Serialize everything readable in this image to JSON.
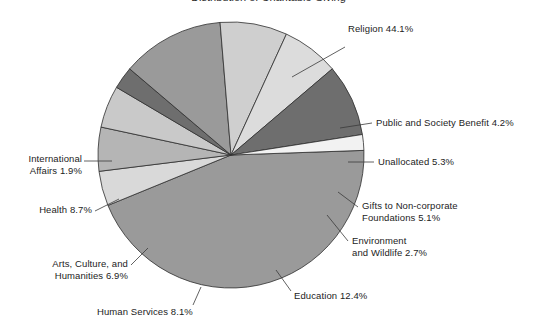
{
  "title": "Distribution of Charitable Giving",
  "chart_data": {
    "type": "pie",
    "title": "Distribution of Charitable Giving",
    "xlabel": "",
    "ylabel": "",
    "legend_position": "none",
    "grid": false,
    "labels_outside": true,
    "categories": [
      "Religion",
      "Public and Society Benefit",
      "Unallocated",
      "Gifts to Non-corporate Foundations",
      "Environment and Wildlife",
      "Education",
      "Human Services",
      "Arts, Culture, and Humanities",
      "Health",
      "International Affairs"
    ],
    "values": [
      44.1,
      4.2,
      5.3,
      5.1,
      2.7,
      12.4,
      8.1,
      6.9,
      8.7,
      1.9
    ],
    "value_suffix": "%",
    "colors": [
      "#9a9a9a",
      "#d9d9d9",
      "#b5b5b5",
      "#c9c9c9",
      "#6e6e6e",
      "#9a9a9a",
      "#cfcfcf",
      "#dcdcdc",
      "#6e6e6e",
      "#f2f2f2"
    ],
    "start_angle_deg": -2,
    "direction": "clockwise"
  },
  "slices": [
    {
      "name": "religion",
      "label": "Religion 44.1%"
    },
    {
      "name": "public-society",
      "label": "Public and Society Benefit 4.2%"
    },
    {
      "name": "unallocated",
      "label": "Unallocated 5.3%"
    },
    {
      "name": "gifts-foundations",
      "label": "Gifts to Non-corporate\nFoundations 5.1%"
    },
    {
      "name": "environment",
      "label": "Environment\nand Wildlife 2.7%"
    },
    {
      "name": "education",
      "label": "Education 12.4%"
    },
    {
      "name": "human-services",
      "label": "Human Services 8.1%"
    },
    {
      "name": "arts-culture",
      "label": "Arts, Culture, and\nHumanities 6.9%"
    },
    {
      "name": "health",
      "label": "Health 8.7%"
    },
    {
      "name": "international",
      "label": "International\nAffairs 1.9%"
    }
  ]
}
